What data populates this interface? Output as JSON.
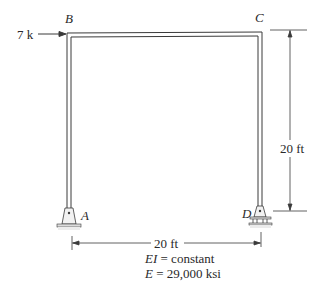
{
  "diagram": {
    "type": "portal frame",
    "nodes": [
      {
        "id": "A",
        "label": "A",
        "support": "pin"
      },
      {
        "id": "B",
        "label": "B"
      },
      {
        "id": "C",
        "label": "C"
      },
      {
        "id": "D",
        "label": "D",
        "support": "roller"
      }
    ],
    "load": {
      "label": "7 k",
      "at": "B",
      "direction": "right"
    },
    "dimensions": {
      "height": "20 ft",
      "span": "20 ft"
    },
    "properties": {
      "ei": "EI = constant",
      "ei_prefix": "EI",
      "ei_value": "= constant",
      "e_prefix": "E",
      "e_value": "= 29,000 ksi"
    },
    "colors": {
      "line": "#3a3a3a",
      "support_fill": "#e6e6e6",
      "text": "#2a2a2a"
    }
  }
}
